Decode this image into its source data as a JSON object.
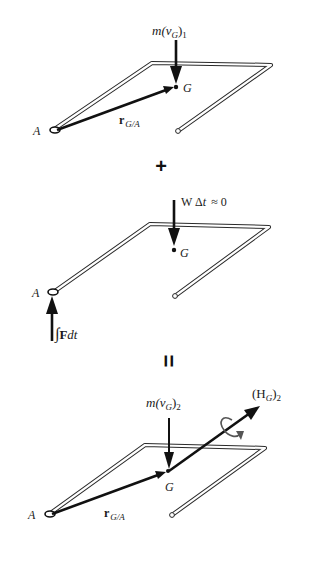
{
  "figure": {
    "panels": [
      {
        "id": "initial-momentum",
        "labels": {
          "momentum": "m(v",
          "momentum_sub": "G",
          "momentum_close": ")",
          "momentum_index": "1",
          "point_a": "A",
          "point_g": "G",
          "position_vector": "r",
          "position_vector_sub": "G/A"
        }
      },
      {
        "id": "impulse",
        "labels": {
          "weight_impulse": "W Δ",
          "weight_impulse_t": "t",
          "weight_impulse_approx": "≈ 0",
          "point_a": "A",
          "point_g": "G",
          "force_impulse_integral": "∫",
          "force_impulse_F": "F",
          "force_impulse_dt": "dt"
        }
      },
      {
        "id": "final-momentum",
        "labels": {
          "momentum": "m(v",
          "momentum_sub": "G",
          "momentum_close": ")",
          "momentum_index": "2",
          "angular_momentum": "(H",
          "angular_momentum_sub": "G",
          "angular_momentum_close": ")",
          "angular_momentum_index": "2",
          "point_a": "A",
          "point_g": "G",
          "position_vector": "r",
          "position_vector_sub": "G/A"
        }
      }
    ],
    "operators": {
      "plus": "+",
      "equals": "="
    },
    "colors": {
      "ink": "#111111",
      "background": "#ffffff"
    }
  }
}
